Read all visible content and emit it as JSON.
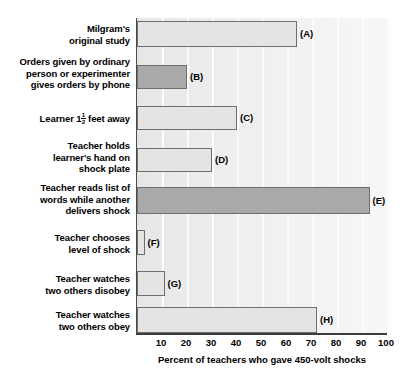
{
  "chart_data": {
    "type": "bar",
    "orientation": "horizontal",
    "title": "",
    "xlabel": "Percent of teachers who gave 450-volt shocks",
    "ylabel": "",
    "xlim": [
      0,
      100
    ],
    "xticks": [
      10,
      20,
      30,
      40,
      50,
      60,
      70,
      80,
      90,
      100
    ],
    "xtick_labels": [
      "10",
      "20",
      "30",
      "40",
      "50",
      "60",
      "70",
      "80",
      "90",
      "100"
    ],
    "grid": true,
    "grid_axis": "x",
    "legend": "none",
    "categories": [
      "Milgram's\noriginal study",
      "Orders given by ordinary\nperson or experimenter\ngives orders by phone",
      "Learner 1½ feet away",
      "Teacher holds\nlearner's hand on\nshock plate",
      "Teacher reads list of\nwords while another\ndelivers shock",
      "Teacher chooses\nlevel of shock",
      "Teacher watches\ntwo others disobey",
      "Teacher watches\ntwo others obey"
    ],
    "values": [
      64,
      20,
      40,
      30,
      93,
      3,
      11,
      72
    ],
    "point_labels": [
      "(A)",
      "(B)",
      "(C)",
      "(D)",
      "(E)",
      "(F)",
      "(G)",
      "(H)"
    ],
    "bar_styles": [
      "light",
      "dark",
      "light",
      "light",
      "dark",
      "light",
      "light",
      "light"
    ],
    "colors": {
      "bar_light": "#e4e4e4",
      "bar_dark": "#a9a9a9",
      "bar_edge": "#6e6e6e",
      "plot_background": "#ededed",
      "gridline": "#fbfbfb",
      "axis": "#3c3c3c",
      "text": "#000000",
      "page_background": "#ffffff"
    }
  },
  "bars": [
    {
      "key": "A",
      "label_line1": "Milgram's",
      "label_line2": "original study",
      "label_line3": "",
      "tag": "(A)",
      "value": 64,
      "style": "light",
      "top": 21,
      "height": 26,
      "label_top": 23
    },
    {
      "key": "B",
      "label_line1": "Orders given by ordinary",
      "label_line2": "person or experimenter",
      "label_line3": "gives orders by phone",
      "tag": "(B)",
      "value": 20,
      "style": "dark",
      "top": 65,
      "height": 24,
      "label_top": 56
    },
    {
      "key": "C",
      "label_line1": "Learner 1½ feet away",
      "label_line2": "",
      "label_line3": "",
      "tag": "(C)",
      "value": 40,
      "style": "light",
      "top": 106,
      "height": 24,
      "label_top": 112
    },
    {
      "key": "D",
      "label_line1": "Teacher holds",
      "label_line2": "learner's hand on",
      "label_line3": "shock plate",
      "tag": "(D)",
      "value": 30,
      "style": "light",
      "top": 148,
      "height": 24,
      "label_top": 140
    },
    {
      "key": "E",
      "label_line1": "Teacher reads list of",
      "label_line2": "words while another",
      "label_line3": "delivers shock",
      "tag": "(E)",
      "value": 93,
      "style": "dark",
      "top": 187,
      "height": 27,
      "label_top": 182
    },
    {
      "key": "F",
      "label_line1": "Teacher chooses",
      "label_line2": "level of shock",
      "label_line3": "",
      "tag": "(F)",
      "value": 3,
      "style": "light",
      "top": 230,
      "height": 25,
      "label_top": 232
    },
    {
      "key": "G",
      "label_line1": "Teacher watches",
      "label_line2": "two others disobey",
      "label_line3": "",
      "tag": "(G)",
      "value": 11,
      "style": "light",
      "top": 271,
      "height": 25,
      "label_top": 273
    },
    {
      "key": "H",
      "label_line1": "Teacher watches",
      "label_line2": "two others obey",
      "label_line3": "",
      "tag": "(H)",
      "value": 72,
      "style": "light",
      "top": 307,
      "height": 26,
      "label_top": 309
    }
  ],
  "axis": {
    "title": "Percent of teachers who gave 450-volt shocks",
    "ticks": [
      "10",
      "20",
      "30",
      "40",
      "50",
      "60",
      "70",
      "80",
      "90",
      "100"
    ]
  }
}
